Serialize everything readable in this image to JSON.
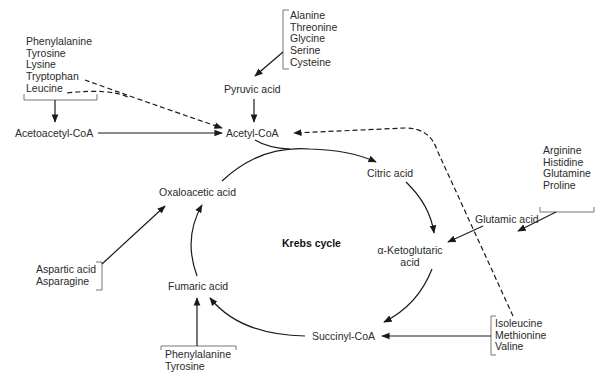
{
  "title": "Krebs cycle",
  "cycle_nodes": {
    "acetyl_coa": "Acetyl-CoA",
    "citric_acid": "Citric acid",
    "alpha_ketoglutaric_line1": "α-Ketoglutaric",
    "alpha_ketoglutaric_line2": "acid",
    "succinyl_coa": "Succinyl-CoA",
    "fumaric_acid": "Fumaric acid",
    "oxaloacetic_acid": "Oxaloacetic acid"
  },
  "intermediates": {
    "pyruvic_acid": "Pyruvic acid",
    "acetoacetyl_coa": "Acetoacetyl-CoA",
    "glutamic_acid": "Glutamic acid"
  },
  "amino_acid_groups": {
    "ketogenic_top_left": [
      "Phenylalanine",
      "Tyrosine",
      "Lysine",
      "Tryptophan",
      "Leucine"
    ],
    "to_pyruvate": [
      "Alanine",
      "Threonine",
      "Glycine",
      "Serine",
      "Cysteine"
    ],
    "to_glutamate": [
      "Arginine",
      "Histidine",
      "Glutamine",
      "Proline"
    ],
    "to_oxaloacetate": [
      "Aspartic acid",
      "Asparagine"
    ],
    "to_fumarate": [
      "Phenylalanine",
      "Tyrosine"
    ],
    "to_succinyl_coa": [
      "Isoleucine",
      "Methionine",
      "Valine"
    ]
  },
  "colors": {
    "line": "#1a1a1a",
    "text": "#2a2a2a",
    "bracket": "#555555"
  }
}
